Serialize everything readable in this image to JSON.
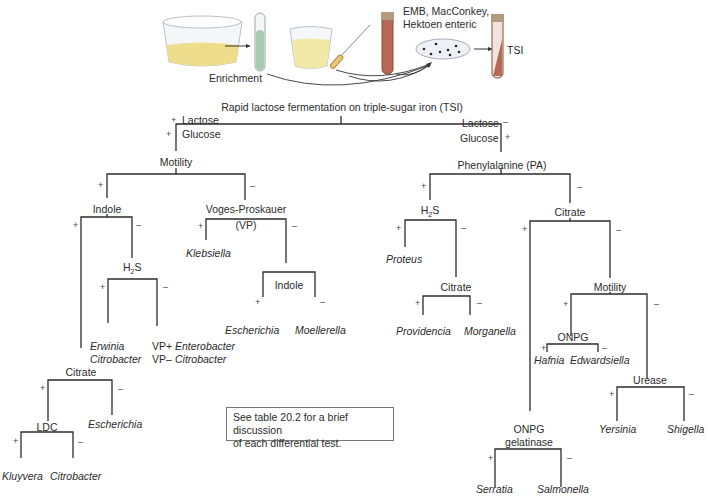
{
  "illustration": {
    "enrichment_label": "Enrichment",
    "media_label_line1": "EMB, MacConkey,",
    "media_label_line2": "Hektoen enteric",
    "tsi_label": "TSI"
  },
  "root": {
    "title": "Rapid lactose fermentation on triple-sugar iron (TSI)",
    "left_lactose": "Lactose",
    "left_glucose": "Glucose",
    "right_lactose": "Lactose",
    "right_glucose": "Glucose",
    "plus": "+",
    "minus": "–"
  },
  "left": {
    "motility": "Motility",
    "indole": "Indole",
    "vp_line1": "Voges-Proskauer",
    "vp_line2": "(VP)",
    "klebsiella": "Klebsiella",
    "h2s_h": "H",
    "h2s_sub": "2",
    "h2s_s": "S",
    "indole2": "Indole",
    "escherichia": "Escherichia",
    "moellerella": "Moellerella",
    "erwinia": "Erwinia",
    "citrobacter1": "Citrobacter",
    "vp_plus": "VP+",
    "enterobacter": "Enterobacter",
    "vp_minus": "VP–",
    "citrobacter2": "Citrobacter",
    "citrate": "Citrate",
    "ldc": "LDC",
    "escherichia2": "Escherichia",
    "kluyvera": "Kluyvera",
    "citrobacter3": "Citrobacter"
  },
  "right": {
    "phenylalanine": "Phenylalanine (PA)",
    "h2s_h": "H",
    "h2s_sub": "2",
    "h2s_s": "S",
    "proteus": "Proteus",
    "citrate_pa": "Citrate",
    "providencia": "Providencia",
    "morganella": "Morganella",
    "citrate": "Citrate",
    "motility": "Motility",
    "onpg": "ONPG",
    "hafnia": "Hafnia",
    "edwardsiella": "Edwardsiella",
    "urease": "Urease",
    "yersinia": "Yersinia",
    "shigella": "Shigella",
    "onpg2_line1": "ONPG",
    "onpg2_line2": "gelatinase",
    "serratia": "Serratia",
    "salmonella": "Salmonella"
  },
  "note": {
    "line1": "See table 20.2 for a brief discussion",
    "line2": "of each differential test."
  },
  "colors": {
    "line": "#2b2b2b",
    "medium_yellow": "#eedd8a",
    "broth_green": "#a9c9b0",
    "tube_red": "#b56a55",
    "cap": "#b49a7c"
  }
}
